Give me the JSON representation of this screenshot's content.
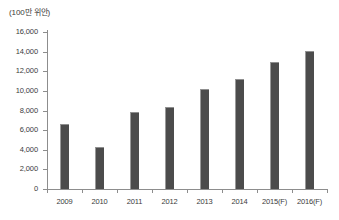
{
  "unit_label": "(100만 위안)",
  "colors": {
    "bar_fill": "#4c4c4c",
    "bar_edge": "#9a9a9a",
    "axis": "#8d8d8d",
    "text": "#3b3b3b",
    "background": "#ffffff"
  },
  "chart_data": {
    "type": "bar",
    "title": "",
    "subtitle": "",
    "xlabel": "",
    "ylabel": "(100만 위안)",
    "categories": [
      "2009",
      "2010",
      "2011",
      "2012",
      "2013",
      "2014",
      "2015(F)",
      "2016(F)"
    ],
    "values": [
      6600,
      4300,
      7800,
      8400,
      10200,
      11200,
      12900,
      14100
    ],
    "series": [
      {
        "name": "",
        "values": [
          6600,
          4300,
          7800,
          8400,
          10200,
          11200,
          12900,
          14100
        ]
      }
    ],
    "ylim": [
      0,
      16000
    ],
    "ytick_values": [
      0,
      2000,
      4000,
      6000,
      8000,
      10000,
      12000,
      14000,
      16000
    ],
    "ytick_labels": [
      "0",
      "2,000",
      "4,000",
      "6,000",
      "8,000",
      "10,000",
      "12,000",
      "14,000",
      "16,000"
    ],
    "grid": false,
    "legend": "none",
    "annotations": []
  }
}
